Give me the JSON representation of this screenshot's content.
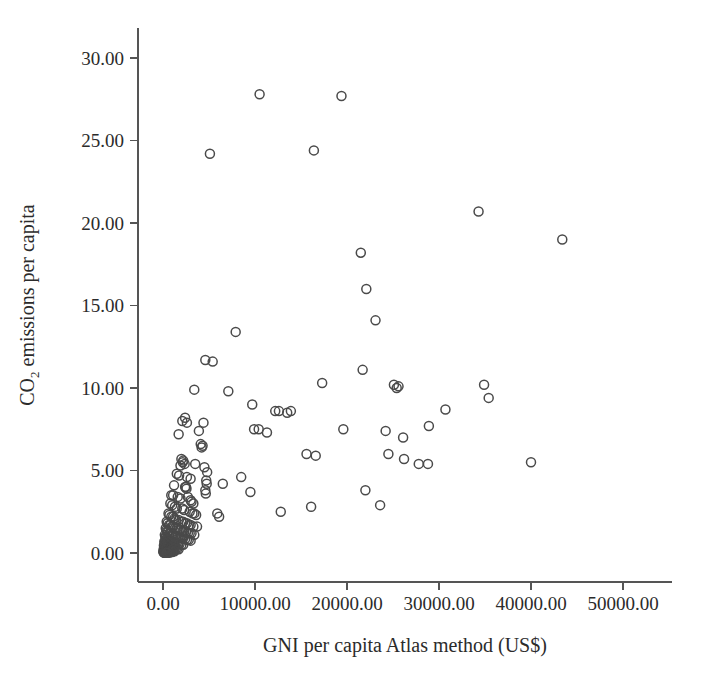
{
  "chart_data": {
    "type": "scatter",
    "title": "",
    "xlabel": "GNI per capita Atlas method (US$)",
    "ylabel_prefix": "CO",
    "ylabel_sub": "2",
    "ylabel_suffix": " emissions per capita",
    "ylabel_plain": "CO2 emissions per capita",
    "xlim": [
      -2700,
      55500
    ],
    "ylim": [
      -1.7,
      31.8
    ],
    "grid": false,
    "legend": null,
    "marker": "open-circle",
    "marker_color": "#4a4a4a",
    "marker_size_px": 9,
    "xticks": [
      0,
      10000,
      20000,
      30000,
      40000,
      50000
    ],
    "xticklabels": [
      "0.00",
      "10000.00",
      "20000.00",
      "30000.00",
      "40000.00",
      "50000.00"
    ],
    "yticks": [
      0,
      5,
      10,
      15,
      20,
      25,
      30
    ],
    "yticklabels": [
      "0.00",
      "5.00",
      "10.00",
      "15.00",
      "20.00",
      "25.00",
      "30.00"
    ],
    "points": [
      [
        10500,
        27.8
      ],
      [
        19400,
        27.7
      ],
      [
        5100,
        24.2
      ],
      [
        16400,
        24.4
      ],
      [
        34300,
        20.7
      ],
      [
        43400,
        19.0
      ],
      [
        21500,
        18.2
      ],
      [
        22100,
        16.0
      ],
      [
        23100,
        14.1
      ],
      [
        7900,
        13.4
      ],
      [
        4600,
        11.7
      ],
      [
        5400,
        11.6
      ],
      [
        21700,
        11.1
      ],
      [
        3400,
        9.9
      ],
      [
        7100,
        9.8
      ],
      [
        17300,
        10.3
      ],
      [
        25100,
        10.2
      ],
      [
        25400,
        10.0
      ],
      [
        25600,
        10.1
      ],
      [
        34900,
        10.2
      ],
      [
        35400,
        9.4
      ],
      [
        9700,
        9.0
      ],
      [
        12200,
        8.6
      ],
      [
        12600,
        8.6
      ],
      [
        13500,
        8.5
      ],
      [
        13900,
        8.6
      ],
      [
        30700,
        8.7
      ],
      [
        2400,
        8.2
      ],
      [
        2100,
        8.0
      ],
      [
        2600,
        7.9
      ],
      [
        4400,
        7.9
      ],
      [
        3900,
        7.4
      ],
      [
        9900,
        7.5
      ],
      [
        10400,
        7.5
      ],
      [
        11300,
        7.3
      ],
      [
        19600,
        7.5
      ],
      [
        24200,
        7.4
      ],
      [
        26100,
        7.0
      ],
      [
        28900,
        7.7
      ],
      [
        1700,
        7.2
      ],
      [
        4100,
        6.6
      ],
      [
        4200,
        6.4
      ],
      [
        4300,
        6.5
      ],
      [
        15600,
        6.0
      ],
      [
        16600,
        5.9
      ],
      [
        24500,
        6.0
      ],
      [
        26200,
        5.7
      ],
      [
        2000,
        5.7
      ],
      [
        2200,
        5.6
      ],
      [
        2150,
        5.5
      ],
      [
        2350,
        5.4
      ],
      [
        1900,
        5.3
      ],
      [
        3500,
        5.4
      ],
      [
        4500,
        5.2
      ],
      [
        4800,
        4.9
      ],
      [
        27800,
        5.4
      ],
      [
        28800,
        5.4
      ],
      [
        40000,
        5.5
      ],
      [
        1500,
        4.8
      ],
      [
        1750,
        4.7
      ],
      [
        2600,
        4.6
      ],
      [
        3000,
        4.5
      ],
      [
        4700,
        4.4
      ],
      [
        4750,
        4.2
      ],
      [
        8500,
        4.6
      ],
      [
        6500,
        4.2
      ],
      [
        1200,
        4.1
      ],
      [
        2400,
        4.0
      ],
      [
        2500,
        4.0
      ],
      [
        2550,
        3.9
      ],
      [
        4600,
        3.8
      ],
      [
        4650,
        3.6
      ],
      [
        9500,
        3.7
      ],
      [
        22000,
        3.8
      ],
      [
        900,
        3.5
      ],
      [
        1100,
        3.5
      ],
      [
        1600,
        3.4
      ],
      [
        1900,
        3.3
      ],
      [
        2700,
        3.4
      ],
      [
        3000,
        3.2
      ],
      [
        3100,
        3.1
      ],
      [
        3300,
        3.0
      ],
      [
        16100,
        2.8
      ],
      [
        23600,
        2.9
      ],
      [
        800,
        3.0
      ],
      [
        1000,
        2.9
      ],
      [
        1300,
        2.8
      ],
      [
        1500,
        2.7
      ],
      [
        2100,
        2.7
      ],
      [
        2300,
        2.6
      ],
      [
        2900,
        2.5
      ],
      [
        3200,
        2.4
      ],
      [
        3400,
        2.4
      ],
      [
        3600,
        2.3
      ],
      [
        5900,
        2.4
      ],
      [
        6100,
        2.2
      ],
      [
        12800,
        2.5
      ],
      [
        600,
        2.4
      ],
      [
        700,
        2.3
      ],
      [
        900,
        2.2
      ],
      [
        1100,
        2.2
      ],
      [
        1250,
        2.1
      ],
      [
        1400,
        2.0
      ],
      [
        1700,
        2.0
      ],
      [
        2000,
        1.9
      ],
      [
        2200,
        1.9
      ],
      [
        2400,
        1.8
      ],
      [
        2600,
        1.8
      ],
      [
        2800,
        1.7
      ],
      [
        3000,
        1.7
      ],
      [
        3300,
        1.6
      ],
      [
        3700,
        1.6
      ],
      [
        400,
        1.9
      ],
      [
        500,
        1.8
      ],
      [
        650,
        1.7
      ],
      [
        800,
        1.7
      ],
      [
        950,
        1.6
      ],
      [
        1100,
        1.6
      ],
      [
        1300,
        1.5
      ],
      [
        1500,
        1.5
      ],
      [
        1700,
        1.4
      ],
      [
        1900,
        1.4
      ],
      [
        2100,
        1.3
      ],
      [
        2300,
        1.3
      ],
      [
        2500,
        1.3
      ],
      [
        2700,
        1.2
      ],
      [
        2900,
        1.2
      ],
      [
        3100,
        1.2
      ],
      [
        3400,
        1.1
      ],
      [
        300,
        1.5
      ],
      [
        380,
        1.4
      ],
      [
        450,
        1.3
      ],
      [
        560,
        1.3
      ],
      [
        700,
        1.2
      ],
      [
        850,
        1.2
      ],
      [
        1000,
        1.1
      ],
      [
        1150,
        1.1
      ],
      [
        1300,
        1.0
      ],
      [
        1450,
        1.0
      ],
      [
        1600,
        1.0
      ],
      [
        1800,
        0.95
      ],
      [
        2000,
        0.9
      ],
      [
        2200,
        0.9
      ],
      [
        2400,
        0.85
      ],
      [
        2600,
        0.8
      ],
      [
        2800,
        0.8
      ],
      [
        3000,
        0.75
      ],
      [
        200,
        1.1
      ],
      [
        260,
        1.0
      ],
      [
        320,
        0.95
      ],
      [
        400,
        0.9
      ],
      [
        480,
        0.9
      ],
      [
        560,
        0.85
      ],
      [
        640,
        0.8
      ],
      [
        720,
        0.8
      ],
      [
        800,
        0.75
      ],
      [
        900,
        0.7
      ],
      [
        1000,
        0.7
      ],
      [
        1100,
        0.65
      ],
      [
        1200,
        0.65
      ],
      [
        1350,
        0.6
      ],
      [
        1500,
        0.6
      ],
      [
        1650,
        0.55
      ],
      [
        1800,
        0.55
      ],
      [
        2000,
        0.5
      ],
      [
        2200,
        0.5
      ],
      [
        150,
        0.7
      ],
      [
        200,
        0.65
      ],
      [
        250,
        0.6
      ],
      [
        300,
        0.6
      ],
      [
        360,
        0.55
      ],
      [
        420,
        0.5
      ],
      [
        480,
        0.5
      ],
      [
        540,
        0.45
      ],
      [
        600,
        0.45
      ],
      [
        660,
        0.4
      ],
      [
        720,
        0.4
      ],
      [
        800,
        0.38
      ],
      [
        880,
        0.35
      ],
      [
        960,
        0.35
      ],
      [
        1050,
        0.3
      ],
      [
        1150,
        0.3
      ],
      [
        1250,
        0.28
      ],
      [
        1400,
        0.25
      ],
      [
        1550,
        0.25
      ],
      [
        1700,
        0.22
      ],
      [
        100,
        0.45
      ],
      [
        140,
        0.4
      ],
      [
        180,
        0.38
      ],
      [
        220,
        0.35
      ],
      [
        260,
        0.33
      ],
      [
        300,
        0.3
      ],
      [
        340,
        0.3
      ],
      [
        390,
        0.28
      ],
      [
        440,
        0.25
      ],
      [
        490,
        0.25
      ],
      [
        540,
        0.22
      ],
      [
        600,
        0.2
      ],
      [
        660,
        0.2
      ],
      [
        730,
        0.18
      ],
      [
        800,
        0.18
      ],
      [
        880,
        0.15
      ],
      [
        960,
        0.15
      ],
      [
        1050,
        0.12
      ],
      [
        1150,
        0.12
      ],
      [
        1250,
        0.1
      ],
      [
        80,
        0.25
      ],
      [
        110,
        0.22
      ],
      [
        150,
        0.2
      ],
      [
        190,
        0.2
      ],
      [
        230,
        0.18
      ],
      [
        270,
        0.16
      ],
      [
        310,
        0.15
      ],
      [
        350,
        0.15
      ],
      [
        400,
        0.13
      ],
      [
        450,
        0.12
      ],
      [
        500,
        0.12
      ],
      [
        560,
        0.1
      ],
      [
        620,
        0.1
      ],
      [
        690,
        0.09
      ],
      [
        760,
        0.08
      ],
      [
        840,
        0.08
      ],
      [
        920,
        0.07
      ],
      [
        1000,
        0.06
      ],
      [
        60,
        0.12
      ],
      [
        90,
        0.1
      ],
      [
        120,
        0.1
      ],
      [
        160,
        0.09
      ],
      [
        200,
        0.08
      ],
      [
        240,
        0.08
      ],
      [
        280,
        0.07
      ],
      [
        320,
        0.06
      ],
      [
        370,
        0.06
      ],
      [
        420,
        0.05
      ],
      [
        470,
        0.05
      ],
      [
        520,
        0.04
      ],
      [
        580,
        0.04
      ],
      [
        650,
        0.03
      ],
      [
        720,
        0.03
      ],
      [
        50,
        0.05
      ],
      [
        80,
        0.04
      ],
      [
        110,
        0.04
      ],
      [
        150,
        0.03
      ],
      [
        190,
        0.03
      ],
      [
        230,
        0.02
      ],
      [
        280,
        0.02
      ],
      [
        330,
        0.02
      ],
      [
        390,
        0.01
      ],
      [
        450,
        0.01
      ]
    ]
  },
  "geometry": {
    "plot_left_px": 138,
    "plot_right_px": 672,
    "plot_top_px": 28,
    "plot_bottom_px": 582,
    "x0_px": 163,
    "x_px_per_10000": 92,
    "y0_px": 553,
    "y_px_per_unit": 16.5,
    "tick_len_px": 8
  }
}
